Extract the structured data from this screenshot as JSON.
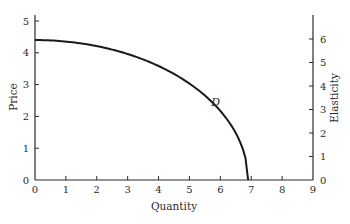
{
  "chart_data": {
    "type": "line",
    "title": "",
    "xlabel": "Quantity",
    "ylabel": "Price",
    "y2label": "Elasticity",
    "xlim": [
      0,
      9
    ],
    "ylim": [
      0,
      5
    ],
    "y2lim": [
      0,
      6.75
    ],
    "x_ticks": [
      0,
      1,
      2,
      3,
      4,
      5,
      6,
      7,
      8,
      9
    ],
    "y_ticks": [
      0,
      1,
      2,
      3,
      4,
      5
    ],
    "y2_ticks": [
      0,
      1,
      2,
      3,
      4,
      5,
      6
    ],
    "grid": false,
    "legend": null,
    "series": [
      {
        "name": "D",
        "label": "D",
        "axis": "left",
        "x": [
          0,
          1,
          2,
          3,
          4,
          5,
          5.5,
          6,
          6.3,
          6.5,
          6.7,
          6.9
        ],
        "y": [
          4.4,
          4.35,
          4.21,
          3.96,
          3.59,
          3.03,
          2.66,
          2.17,
          1.79,
          1.48,
          1.05,
          0
        ]
      }
    ],
    "annotations": [
      {
        "text": "D",
        "x": 5.8,
        "y": 2.45,
        "style": "italic"
      }
    ],
    "color": "#1a1a1a"
  },
  "plot": {
    "x_axis_title": "Quantity",
    "y_axis_title": "Price",
    "y2_axis_title": "Elasticity",
    "curve_label": "D"
  }
}
